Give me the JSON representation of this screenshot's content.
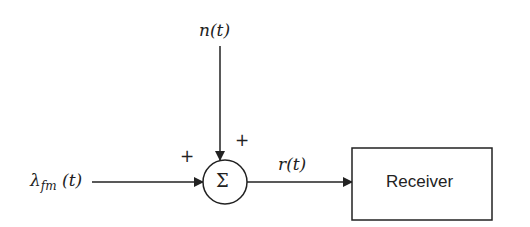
{
  "diagram": {
    "type": "block-diagram",
    "inputs": {
      "signal": {
        "symbol": "λ",
        "subscript": "fm",
        "arg": " (t)",
        "sign": "+"
      },
      "noise": {
        "label": "n(t)",
        "sign": "+"
      }
    },
    "summer": {
      "symbol": "Σ"
    },
    "output": {
      "label": "r(t)"
    },
    "block": {
      "label": "Receiver"
    },
    "colors": {
      "stroke": "#222222",
      "background": "#ffffff"
    }
  }
}
